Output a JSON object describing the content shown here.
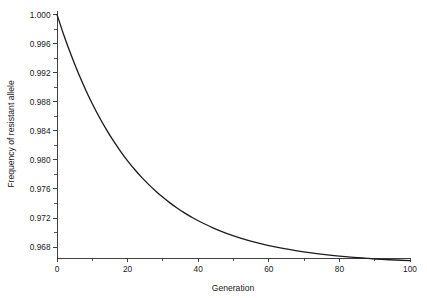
{
  "chart_data": {
    "type": "line",
    "title": "",
    "xlabel": "Generation",
    "ylabel": "Frequency of resistant allele",
    "xlim": [
      0,
      100
    ],
    "ylim": [
      0.9665,
      1.0005
    ],
    "grid": false,
    "legend": null,
    "xticks": [
      0,
      20,
      40,
      60,
      80,
      100
    ],
    "xticklabels": [
      "0",
      "20",
      "40",
      "60",
      "80",
      "100"
    ],
    "xminorticks": [
      10,
      30,
      50,
      70,
      90
    ],
    "yticks": [
      0.968,
      0.972,
      0.976,
      0.98,
      0.984,
      0.988,
      0.992,
      0.996,
      1.0
    ],
    "yticklabels": [
      "0.968",
      "0.972",
      "0.976",
      "0.980",
      "0.984",
      "0.988",
      "0.992",
      "0.996",
      "1.000"
    ],
    "yminorticks": [
      0.97,
      0.974,
      0.978,
      0.982,
      0.986,
      0.99,
      0.994,
      0.998
    ],
    "line_color": "#1d1d1d",
    "axis_color": "#2b2b2b",
    "background": "#ffffff",
    "series": [
      {
        "name": "Frequency of resistant allele",
        "x": [
          0,
          2,
          4,
          6,
          8,
          10,
          12,
          14,
          16,
          18,
          20,
          22,
          24,
          26,
          28,
          30,
          32,
          34,
          36,
          38,
          40,
          44,
          48,
          52,
          56,
          60,
          64,
          68,
          72,
          76,
          80,
          84,
          88,
          92,
          96,
          100
        ],
        "values": [
          1.0,
          0.99709,
          0.99443,
          0.99199,
          0.98977,
          0.98773,
          0.98587,
          0.98417,
          0.98261,
          0.98119,
          0.97988,
          0.97869,
          0.9776,
          0.9766,
          0.97569,
          0.97485,
          0.97409,
          0.97339,
          0.97275,
          0.97216,
          0.97163,
          0.97069,
          0.9699,
          0.96924,
          0.96868,
          0.96821,
          0.96782,
          0.96748,
          0.9672,
          0.96696,
          0.96676,
          0.96659,
          0.96644,
          0.96632,
          0.96622,
          0.96613
        ]
      }
    ]
  },
  "axes": {
    "xlabel": "Generation",
    "ylabel": "Frequency of resistant allele"
  }
}
